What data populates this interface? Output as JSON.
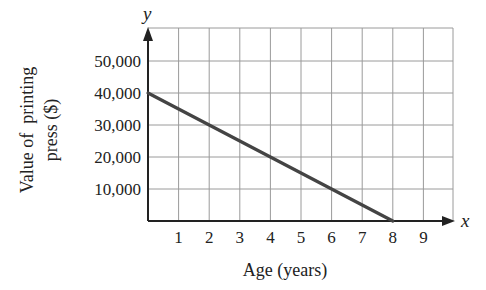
{
  "chart_data": {
    "type": "line",
    "title": "",
    "xlabel": "Age (years)",
    "ylabel": "Value of printing press ($)",
    "ylabel_lines": [
      "Value of  printing",
      "press ($)"
    ],
    "x_axis_var": "x",
    "y_axis_var": "y",
    "x": [
      0,
      8
    ],
    "series": [
      {
        "name": "Value",
        "x": [
          0,
          8
        ],
        "values": [
          40000,
          0
        ],
        "color": "#444444"
      }
    ],
    "xticks": [
      "1",
      "2",
      "3",
      "4",
      "5",
      "6",
      "7",
      "8",
      "9"
    ],
    "yticks": [
      "10,000",
      "20,000",
      "30,000",
      "40,000",
      "50,000"
    ],
    "xlim": [
      0,
      9.7
    ],
    "ylim": [
      0,
      60000
    ],
    "grid": true,
    "legend": null
  },
  "colors": {
    "line": "#444444",
    "grid": "#9a9a9a",
    "axis": "#222222"
  }
}
